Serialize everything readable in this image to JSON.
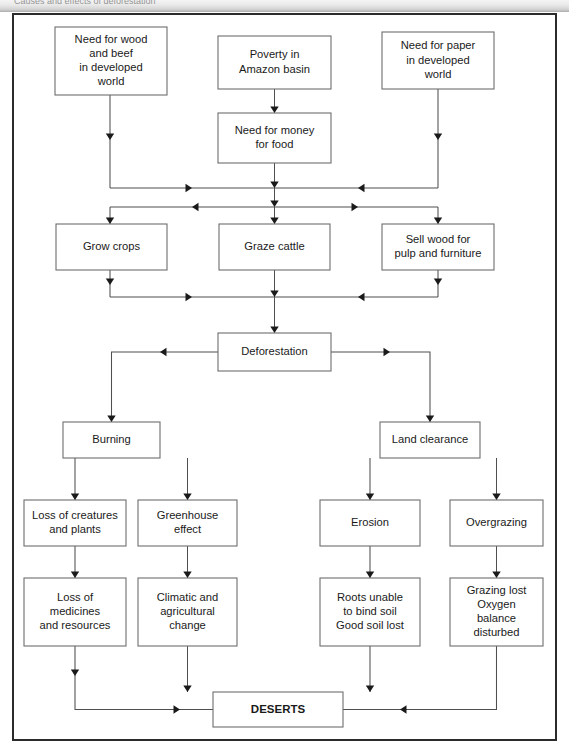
{
  "header": {
    "strip_text": "Causes and effects of deforestation"
  },
  "diagram": {
    "nodes": [
      {
        "id": "need_wood_beef",
        "label": "Need for wood\nand beef\nin developed\nworld",
        "x": 55,
        "y": 27,
        "w": 112,
        "h": 68
      },
      {
        "id": "poverty_amazon",
        "label": "Poverty in\nAmazon basin",
        "x": 218,
        "y": 36,
        "w": 113,
        "h": 53
      },
      {
        "id": "need_paper",
        "label": "Need for paper\nin developed\nworld",
        "x": 382,
        "y": 32,
        "w": 112,
        "h": 57
      },
      {
        "id": "need_money_food",
        "label": "Need for money\nfor food",
        "x": 218,
        "y": 113,
        "w": 113,
        "h": 50
      },
      {
        "id": "grow_crops",
        "label": "Grow crops",
        "x": 56,
        "y": 224,
        "w": 111,
        "h": 46
      },
      {
        "id": "graze_cattle",
        "label": "Graze cattle",
        "x": 219,
        "y": 224,
        "w": 111,
        "h": 46
      },
      {
        "id": "sell_wood",
        "label": "Sell wood for\npulp and furniture",
        "x": 382,
        "y": 224,
        "w": 112,
        "h": 46
      },
      {
        "id": "deforestation",
        "label": "Deforestation",
        "x": 218,
        "y": 333,
        "w": 113,
        "h": 38
      },
      {
        "id": "burning",
        "label": "Burning",
        "x": 63,
        "y": 422,
        "w": 97,
        "h": 36
      },
      {
        "id": "land_clearance",
        "label": "Land clearance",
        "x": 380,
        "y": 422,
        "w": 100,
        "h": 36
      },
      {
        "id": "loss_creatures",
        "label": "Loss of creatures\nand plants",
        "x": 24,
        "y": 500,
        "w": 102,
        "h": 46
      },
      {
        "id": "greenhouse",
        "label": "Greenhouse\neffect",
        "x": 138,
        "y": 500,
        "w": 99,
        "h": 46
      },
      {
        "id": "erosion",
        "label": "Erosion",
        "x": 320,
        "y": 500,
        "w": 100,
        "h": 46
      },
      {
        "id": "overgrazing",
        "label": "Overgrazing",
        "x": 450,
        "y": 500,
        "w": 93,
        "h": 46
      },
      {
        "id": "loss_medicines",
        "label": "Loss of\nmedicines\nand resources",
        "x": 24,
        "y": 578,
        "w": 102,
        "h": 68
      },
      {
        "id": "climatic",
        "label": "Climatic and\nagricultural\nchange",
        "x": 138,
        "y": 578,
        "w": 99,
        "h": 68
      },
      {
        "id": "roots_unable",
        "label": "Roots unable\nto bind soil\nGood soil lost",
        "x": 320,
        "y": 578,
        "w": 100,
        "h": 68
      },
      {
        "id": "grazing_lost",
        "label": "Grazing lost\nOxygen\nbalance\ndisturbed",
        "x": 450,
        "y": 578,
        "w": 93,
        "h": 68
      },
      {
        "id": "deserts",
        "label": "DESERTS",
        "x": 213,
        "y": 692,
        "w": 130,
        "h": 35,
        "bold": true
      }
    ],
    "edges": [
      {
        "from": "need_wood_beef",
        "to": "bus_upper_left",
        "label": ""
      },
      {
        "from": "poverty_amazon",
        "to": "need_money_food",
        "label": ""
      },
      {
        "from": "need_paper",
        "to": "bus_upper_right",
        "label": ""
      },
      {
        "from": "need_money_food",
        "to": "bus_upper",
        "label": ""
      },
      {
        "from": "bus_upper",
        "to": "grow_crops",
        "label": ""
      },
      {
        "from": "bus_upper",
        "to": "graze_cattle",
        "label": ""
      },
      {
        "from": "bus_upper",
        "to": "sell_wood",
        "label": ""
      },
      {
        "from": "grow_crops",
        "to": "bus_lower",
        "label": ""
      },
      {
        "from": "graze_cattle",
        "to": "deforestation",
        "label": ""
      },
      {
        "from": "sell_wood",
        "to": "bus_lower",
        "label": ""
      },
      {
        "from": "deforestation",
        "to": "burning",
        "label": ""
      },
      {
        "from": "deforestation",
        "to": "land_clearance",
        "label": ""
      },
      {
        "from": "burning",
        "to": "loss_creatures",
        "label": ""
      },
      {
        "from": "burning",
        "to": "greenhouse",
        "label": ""
      },
      {
        "from": "land_clearance",
        "to": "erosion",
        "label": ""
      },
      {
        "from": "land_clearance",
        "to": "overgrazing",
        "label": ""
      },
      {
        "from": "loss_creatures",
        "to": "loss_medicines",
        "label": ""
      },
      {
        "from": "greenhouse",
        "to": "climatic",
        "label": ""
      },
      {
        "from": "erosion",
        "to": "roots_unable",
        "label": ""
      },
      {
        "from": "overgrazing",
        "to": "grazing_lost",
        "label": ""
      },
      {
        "from": "loss_medicines",
        "to": "deserts",
        "label": ""
      },
      {
        "from": "climatic",
        "to": "deserts",
        "label": ""
      },
      {
        "from": "roots_unable",
        "to": "deserts",
        "label": ""
      },
      {
        "from": "grazing_lost",
        "to": "deserts",
        "label": ""
      }
    ],
    "colors": {
      "box_border": "#6d6d6d",
      "box_fill": "#ffffff",
      "connector": "#4f4f4f",
      "arrow": "#1a1a1a",
      "frame": "#2b2b2b",
      "text": "#1a1a1a"
    }
  }
}
